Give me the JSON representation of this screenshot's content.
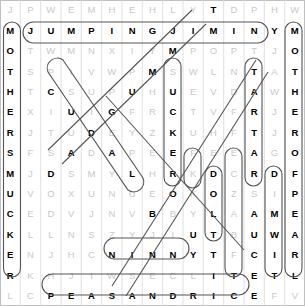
{
  "puzzle": {
    "title": "Word Search Grid",
    "columns": 15,
    "rows": 17,
    "letter_color": "#c9c9c9",
    "found_letter_color": "#000000",
    "mark_color": "#555555",
    "grid": [
      [
        "J",
        "P",
        "W",
        "E",
        "M",
        "H",
        "E",
        "H",
        "L",
        "Y",
        "T",
        "D",
        "P",
        "H",
        "W"
      ],
      [
        "M",
        "J",
        "U",
        "M",
        "P",
        "I",
        "N",
        "G",
        "J",
        "I",
        "M",
        "I",
        "N",
        "Y",
        "M"
      ],
      [
        "O",
        "T",
        "W",
        "M",
        "N",
        "X",
        "I",
        "Y",
        "M",
        "P",
        "O",
        "P",
        "T",
        "J",
        "O"
      ],
      [
        "T",
        "S",
        "P",
        "I",
        "V",
        "W",
        "P",
        "M",
        "S",
        "W",
        "L",
        "N",
        "T",
        "A",
        "T"
      ],
      [
        "H",
        "T",
        "C",
        "S",
        "U",
        "P",
        "U",
        "H",
        "U",
        "E",
        "V",
        "D",
        "A",
        "W",
        "H"
      ],
      [
        "E",
        "X",
        "I",
        "U",
        "I",
        "G",
        "F",
        "R",
        "C",
        "T",
        "V",
        "F",
        "R",
        "J",
        "E"
      ],
      [
        "R",
        "J",
        "T",
        "U",
        "D",
        "E",
        "Y",
        "Z",
        "K",
        "U",
        "H",
        "F",
        "T",
        "J",
        "R"
      ],
      [
        "S",
        "F",
        "S",
        "A",
        "D",
        "A",
        "P",
        "E",
        "E",
        "F",
        "E",
        "E",
        "A",
        "G",
        "O"
      ],
      [
        "M",
        "J",
        "D",
        "S",
        "M",
        "Y",
        "L",
        "H",
        "R",
        "K",
        "D",
        "C",
        "R",
        "D",
        "F"
      ],
      [
        "U",
        "V",
        "O",
        "X",
        "U",
        "N",
        "U",
        "E",
        "O",
        "K",
        "O",
        "Z",
        "S",
        "I",
        "P"
      ],
      [
        "C",
        "E",
        "D",
        "V",
        "J",
        "N",
        "V",
        "B",
        "B",
        "Y",
        "L",
        "A",
        "A",
        "M",
        "E"
      ],
      [
        "K",
        "L",
        "L",
        "N",
        "S",
        "Z",
        "Y",
        "J",
        "I",
        "U",
        "T",
        "B",
        "U",
        "W",
        "A"
      ],
      [
        "E",
        "N",
        "J",
        "H",
        "C",
        "N",
        "I",
        "N",
        "N",
        "Y",
        "T",
        "F",
        "C",
        "I",
        "R"
      ],
      [
        "R",
        "K",
        "H",
        "J",
        "I",
        "W",
        "S",
        "E",
        "C",
        "L",
        "I",
        "T",
        "E",
        "T",
        "L"
      ],
      [
        "L",
        "C",
        "P",
        "E",
        "A",
        "S",
        "A",
        "N",
        "D",
        "R",
        "I",
        "C",
        "E",
        "F",
        "V"
      ]
    ],
    "found_cells": [
      [
        1,
        0
      ],
      [
        2,
        0
      ],
      [
        3,
        0
      ],
      [
        4,
        0
      ],
      [
        5,
        0
      ],
      [
        6,
        0
      ],
      [
        7,
        0
      ],
      [
        8,
        0
      ],
      [
        9,
        0
      ],
      [
        10,
        0
      ],
      [
        11,
        0
      ],
      [
        12,
        0
      ],
      [
        13,
        0
      ],
      [
        1,
        1
      ],
      [
        1,
        2
      ],
      [
        1,
        3
      ],
      [
        1,
        4
      ],
      [
        1,
        5
      ],
      [
        1,
        6
      ],
      [
        1,
        7
      ],
      [
        1,
        8
      ],
      [
        1,
        9
      ],
      [
        1,
        10
      ],
      [
        1,
        11
      ],
      [
        1,
        12
      ],
      [
        1,
        13
      ],
      [
        1,
        14
      ],
      [
        1,
        14
      ],
      [
        2,
        14
      ],
      [
        3,
        14
      ],
      [
        4,
        14
      ],
      [
        5,
        14
      ],
      [
        6,
        14
      ],
      [
        7,
        14
      ],
      [
        8,
        14
      ],
      [
        9,
        14
      ],
      [
        10,
        14
      ],
      [
        11,
        14
      ],
      [
        12,
        14
      ],
      [
        13,
        14
      ],
      [
        0,
        10
      ],
      [
        2,
        8
      ],
      [
        3,
        7
      ],
      [
        3,
        12
      ],
      [
        4,
        2
      ],
      [
        4,
        6
      ],
      [
        4,
        8
      ],
      [
        4,
        12
      ],
      [
        5,
        3
      ],
      [
        5,
        5
      ],
      [
        5,
        8
      ],
      [
        5,
        12
      ],
      [
        6,
        4
      ],
      [
        6,
        8
      ],
      [
        6,
        12
      ],
      [
        7,
        3
      ],
      [
        7,
        5
      ],
      [
        7,
        8
      ],
      [
        7,
        12
      ],
      [
        8,
        2
      ],
      [
        8,
        6
      ],
      [
        8,
        8
      ],
      [
        8,
        10
      ],
      [
        8,
        12
      ],
      [
        8,
        13
      ],
      [
        9,
        8
      ],
      [
        9,
        10
      ],
      [
        10,
        7
      ],
      [
        10,
        10
      ],
      [
        10,
        12
      ],
      [
        10,
        13
      ],
      [
        11,
        9
      ],
      [
        11,
        10
      ],
      [
        11,
        12
      ],
      [
        11,
        13
      ],
      [
        12,
        5
      ],
      [
        12,
        6
      ],
      [
        12,
        7
      ],
      [
        12,
        8
      ],
      [
        12,
        9
      ],
      [
        12,
        10
      ],
      [
        12,
        12
      ],
      [
        12,
        13
      ],
      [
        13,
        10
      ],
      [
        13,
        11
      ],
      [
        13,
        12
      ],
      [
        13,
        13
      ],
      [
        14,
        2
      ],
      [
        14,
        3
      ],
      [
        14,
        4
      ],
      [
        14,
        5
      ],
      [
        14,
        6
      ],
      [
        14,
        7
      ],
      [
        14,
        8
      ],
      [
        14,
        9
      ],
      [
        14,
        10
      ],
      [
        14,
        11
      ],
      [
        14,
        12
      ]
    ],
    "found_words": [
      {
        "word": "JUMPING JIMINY",
        "orientation": "horizontal",
        "row": 1
      },
      {
        "word": "MOTHERSMUCKER",
        "orientation": "vertical",
        "column": 0
      },
      {
        "word": "MOTHERSMUCKER",
        "orientation": "vertical",
        "column": 14
      },
      {
        "word": "SCUDADSMYLE",
        "orientation": "diagonal-down-right"
      },
      {
        "word": "TARTS",
        "orientation": "vertical",
        "column": 12
      },
      {
        "word": "SUCKER",
        "orientation": "vertical",
        "column": 8
      },
      {
        "word": "NINNY",
        "orientation": "horizontal",
        "row": 12
      },
      {
        "word": "PEASANDRICE",
        "orientation": "horizontal",
        "row": 14
      },
      {
        "word": "DOLT",
        "orientation": "vertical",
        "column": 10
      },
      {
        "word": "DRIP",
        "orientation": "vertical",
        "column": 13
      },
      {
        "word": "TWIT",
        "orientation": "vertical",
        "column": 11
      }
    ]
  }
}
